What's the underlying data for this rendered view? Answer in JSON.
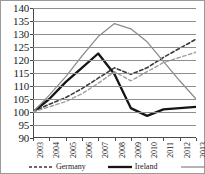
{
  "chart_data": {
    "type": "line",
    "title": "",
    "subtitle": "",
    "xlabel": "",
    "ylabel": "",
    "x": [
      "2003",
      "2004",
      "2005",
      "2006",
      "2007",
      "2008",
      "2009",
      "2010",
      "2011",
      "2012",
      "2013"
    ],
    "categories": [
      "2003",
      "2004",
      "2005",
      "2006",
      "2007",
      "2008",
      "2009",
      "2010",
      "2011",
      "2012",
      "2013"
    ],
    "ylim": [
      90,
      140
    ],
    "yticks": [
      90,
      95,
      100,
      105,
      110,
      115,
      120,
      125,
      130,
      135,
      140
    ],
    "ytick_labels": [
      "90",
      "95",
      "100",
      "105",
      "110",
      "115",
      "120",
      "125",
      "130",
      "135",
      "140"
    ],
    "grid": true,
    "grid_axis": "y",
    "legend_position": "bottom",
    "series": [
      {
        "name": "Germany",
        "style": "dashed",
        "color": "#3a3a3a",
        "width": 1.6,
        "values": [
          100,
          103,
          105.5,
          109,
          113,
          117,
          114.5,
          117,
          121,
          124.5,
          128
        ]
      },
      {
        "name": "Ireland",
        "style": "solid",
        "color": "#151515",
        "width": 2.3,
        "values": [
          100,
          105,
          111.5,
          117,
          122.5,
          114.5,
          101.5,
          98.5,
          101,
          101.5,
          102
        ]
      },
      {
        "name": "Greece",
        "style": "solid",
        "color": "#8c8c8c",
        "width": 1.3,
        "values": [
          100,
          106.5,
          113.5,
          121.5,
          129,
          134,
          132,
          127,
          119.5,
          112,
          105
        ]
      },
      {
        "name": "",
        "style": "dashed",
        "color": "#a0a0a0",
        "width": 1.4,
        "values": [
          100,
          102,
          104,
          107,
          111,
          115.5,
          112,
          115.5,
          119,
          121,
          123
        ]
      }
    ],
    "legend": [
      {
        "label": "Germany",
        "style": "dashed",
        "color": "#3a3a3a",
        "width": 1.6
      },
      {
        "label": "Ireland",
        "style": "solid",
        "color": "#151515",
        "width": 2.3
      },
      {
        "label": "Greece",
        "style": "solid",
        "color": "#8c8c8c",
        "width": 1.3
      }
    ]
  },
  "legend": {
    "germany_label": "Germany",
    "ireland_label": "Ireland",
    "greece_label": "Greece"
  }
}
